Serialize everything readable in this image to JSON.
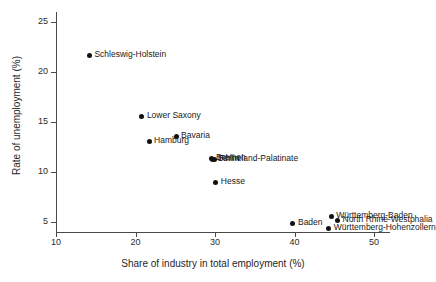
{
  "chart_data": {
    "type": "scatter",
    "title": "",
    "xlabel": "Share of industry in total employment (%)",
    "ylabel": "Rate of unemployment (%)",
    "xlim": [
      10,
      52
    ],
    "ylim": [
      4,
      26
    ],
    "xticks": [
      10,
      20,
      30,
      40,
      50
    ],
    "yticks": [
      5,
      10,
      15,
      20,
      25
    ],
    "grid": false,
    "legend": "none",
    "marker_color": "#111111",
    "axis_color": "#4a4a4a",
    "points": [
      {
        "label": "Schleswig-Holstein",
        "x": 14.2,
        "y": 21.7,
        "label_pos": "right"
      },
      {
        "label": "Lower Saxony",
        "x": 20.8,
        "y": 15.6,
        "label_pos": "right"
      },
      {
        "label": "Bavaria",
        "x": 25.1,
        "y": 13.6,
        "label_pos": "right"
      },
      {
        "label": "Hamburg",
        "x": 21.7,
        "y": 13.1,
        "label_pos": "right"
      },
      {
        "label": "Bremen",
        "x": 29.5,
        "y": 11.4,
        "label_pos": "right"
      },
      {
        "label": "Berlin",
        "x": 29.7,
        "y": 11.3,
        "label_pos": "right"
      },
      {
        "label": "Rhineland-Palatinate",
        "x": 29.9,
        "y": 11.3,
        "label_pos": "right"
      },
      {
        "label": "Hesse",
        "x": 30.1,
        "y": 9.0,
        "label_pos": "right"
      },
      {
        "label": "Baden",
        "x": 39.8,
        "y": 4.9,
        "label_pos": "right"
      },
      {
        "label": "Württemberg-Baden",
        "x": 44.6,
        "y": 5.6,
        "label_pos": "right"
      },
      {
        "label": "North Rhine-Westphalia",
        "x": 45.4,
        "y": 5.2,
        "label_pos": "right"
      },
      {
        "label": "Württemberg-Hohenzollern",
        "x": 44.3,
        "y": 4.4,
        "label_pos": "right"
      }
    ]
  }
}
